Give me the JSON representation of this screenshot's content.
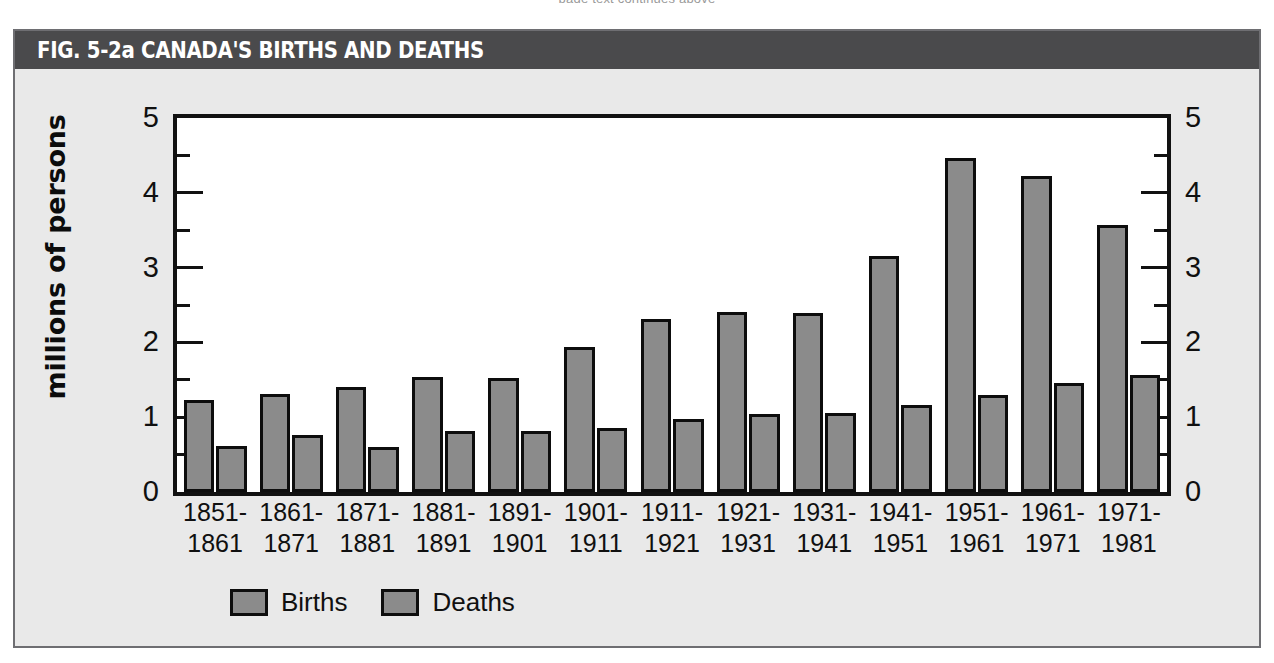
{
  "bleed": {
    "text": "page text continues above"
  },
  "figure": {
    "figure_number": "FIG. 5-2a",
    "title": "CANADA'S BIRTHS AND DEATHS",
    "title_full": "FIG. 5-2a  CANADA'S BIRTHS AND DEATHS",
    "frame_color": "#6e6e72",
    "title_bar_color": "#4a4a4c",
    "panel_color": "#e9e9e9",
    "plot_background": "#ffffff"
  },
  "chart_data": {
    "type": "bar",
    "title": "FIG. 5-2a  CANADA'S BIRTHS AND DEATHS",
    "xlabel": "",
    "ylabel": "millions of persons",
    "ylabel_right": "millions of persons",
    "ylim": [
      0,
      5
    ],
    "yticks": [
      0,
      1,
      2,
      3,
      4,
      5
    ],
    "ytick_labels": [
      "0",
      "1",
      "2",
      "3",
      "4",
      "5"
    ],
    "yminor_ticks": [
      0.5,
      1.5,
      2.5,
      3.5,
      4.5
    ],
    "grid": false,
    "legend_position": "bottom-left",
    "bar_color": "#8b8b8b",
    "bar_edge_color": "#0d0d0d",
    "categories": [
      "1851-\n1861",
      "1861-\n1871",
      "1871-\n1881",
      "1881-\n1891",
      "1891-\n1901",
      "1901-\n1911",
      "1911-\n1921",
      "1921-\n1931",
      "1931-\n1941",
      "1941-\n1951",
      "1951-\n1961",
      "1961-\n1971",
      "1971-\n1981"
    ],
    "category_lines": [
      [
        "1851-",
        "1861"
      ],
      [
        "1861-",
        "1871"
      ],
      [
        "1871-",
        "1881"
      ],
      [
        "1881-",
        "1891"
      ],
      [
        "1891-",
        "1901"
      ],
      [
        "1901-",
        "1911"
      ],
      [
        "1911-",
        "1921"
      ],
      [
        "1921-",
        "1931"
      ],
      [
        "1931-",
        "1941"
      ],
      [
        "1941-",
        "1951"
      ],
      [
        "1951-",
        "1961"
      ],
      [
        "1961-",
        "1971"
      ],
      [
        "1971-",
        "1981"
      ]
    ],
    "series": [
      {
        "name": "Births",
        "values": [
          1.23,
          1.31,
          1.41,
          1.54,
          1.53,
          1.94,
          2.31,
          2.41,
          2.39,
          3.15,
          4.47,
          4.22,
          3.57
        ]
      },
      {
        "name": "Deaths",
        "values": [
          0.62,
          0.76,
          0.6,
          0.81,
          0.81,
          0.86,
          0.98,
          1.04,
          1.06,
          1.16,
          1.3,
          1.46,
          1.57
        ]
      }
    ]
  },
  "legend": {
    "items": [
      {
        "label": "Births"
      },
      {
        "label": "Deaths"
      }
    ]
  }
}
